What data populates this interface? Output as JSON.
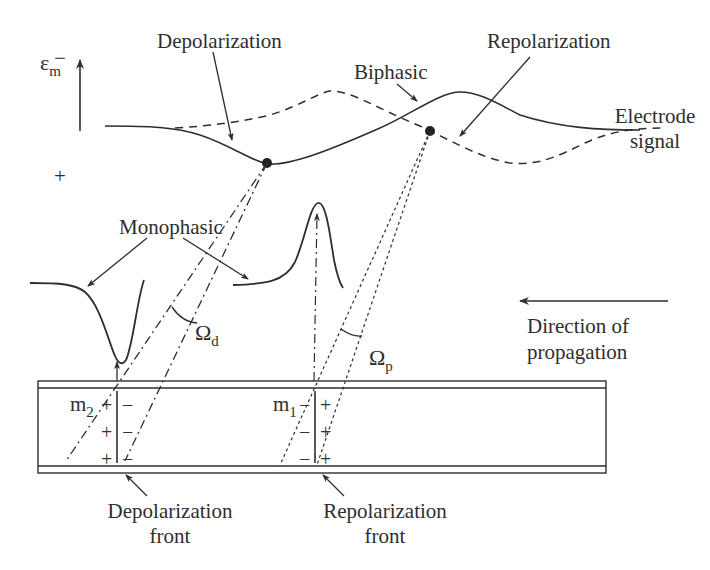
{
  "figure": {
    "labels": {
      "depolarization": "Depolarization",
      "repolarization": "Repolarization",
      "biphasic": "Biphasic",
      "electrode_signal_line1": "Electrode",
      "electrode_signal_line2": "signal",
      "monophasic": "Monophasic",
      "direction_line1": "Direction of",
      "direction_line2": "propagation",
      "depolarization_front_line1": "Depolarization",
      "depolarization_front_line2": "front",
      "repolarization_front_line1": "Repolarization",
      "repolarization_front_line2": "front"
    },
    "axis": {
      "symbol": "ε",
      "symbol_subscript": "m",
      "top_sign": "−",
      "bottom_sign": "+"
    },
    "angles": {
      "depolarization": {
        "symbol": "Ω",
        "subscript": "d"
      },
      "repolarization": {
        "symbol": "Ω",
        "subscript": "p"
      }
    },
    "dipoles": {
      "m2": {
        "label": "m",
        "subscript": "2",
        "left_signs": [
          "+",
          "+",
          "+"
        ],
        "right_signs": [
          "−",
          "−",
          "−"
        ]
      },
      "m1": {
        "label": "m",
        "subscript": "1",
        "left_signs": [
          "−",
          "−",
          "−"
        ],
        "right_signs": [
          "+",
          "+",
          "+"
        ]
      }
    },
    "colors": {
      "ink": "#2e2e2e",
      "background": "#ffffff"
    }
  }
}
